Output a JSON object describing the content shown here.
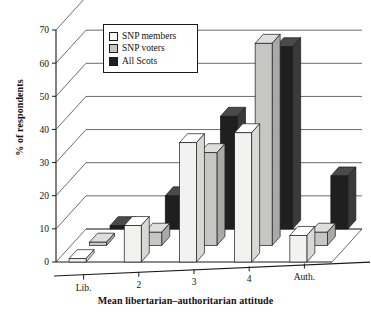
{
  "chart_data": {
    "type": "bar",
    "title": "",
    "xlabel": "Mean libertarian–authoritarian attitude",
    "ylabel": "% of respondents",
    "categories": [
      "Lib.",
      "2",
      "3",
      "4",
      "Auth."
    ],
    "ylim": [
      0,
      70
    ],
    "yticks": [
      0,
      10,
      20,
      30,
      40,
      50,
      60,
      70
    ],
    "grid": true,
    "legend_position": "top-left-inside",
    "projection": "3d-bar",
    "series": [
      {
        "name": "SNP members",
        "values": [
          1,
          11,
          36,
          39,
          8
        ],
        "color": "#f2f2f0"
      },
      {
        "name": "SNP voters",
        "values": [
          1,
          4,
          28,
          61,
          4
        ],
        "color": "#c6c6c2"
      },
      {
        "name": "All Scots",
        "values": [
          1,
          10,
          34,
          55,
          16
        ],
        "color": "#1f1f1f"
      }
    ]
  },
  "axes": {
    "y_tick_labels": [
      "0",
      "10",
      "20",
      "30",
      "40",
      "50",
      "60",
      "70"
    ],
    "x_tick_labels": [
      "Lib.",
      "2",
      "3",
      "4",
      "Auth."
    ],
    "y_axis_title": "% of respondents",
    "x_axis_title": "Mean libertarian–authoritarian attitude"
  },
  "legend": {
    "items": [
      {
        "label": "SNP members",
        "swatch": "#f7f7f5"
      },
      {
        "label": "SNP voters",
        "swatch": "#c6c6c2"
      },
      {
        "label": "All Scots",
        "swatch": "#1f1f1f"
      }
    ]
  }
}
